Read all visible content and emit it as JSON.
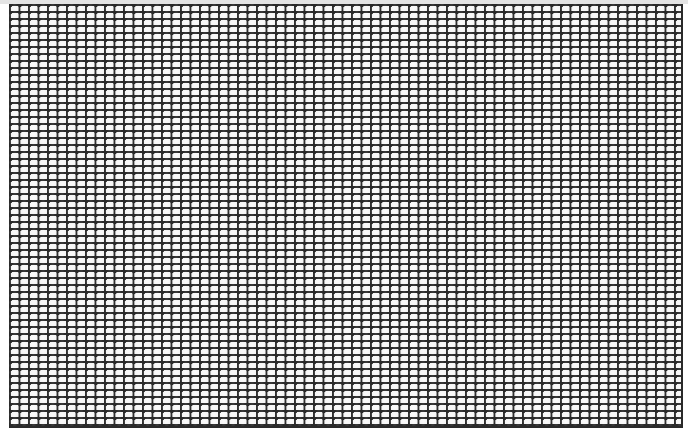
{
  "image": {
    "description": "Dense black wire mesh grid of rounded rectangular cells on a light background",
    "grid": {
      "cell_width_px": 9.5,
      "cell_height_px": 7,
      "line_color": "#2a2a2a",
      "cell_fill_color": "#f4f4f4",
      "background_color": "#ffffff",
      "top_band_color": "#e4e4e4"
    }
  }
}
